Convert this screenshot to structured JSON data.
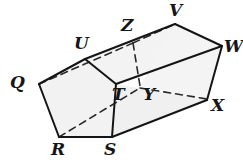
{
  "figure": {
    "type": "geometric-solid-diagram",
    "width": 243,
    "height": 166,
    "background_color": "#ffffff",
    "stroke_color": "#1a1a1a",
    "face_fill_color": "#f2f2f2",
    "hidden_edge_style": "dashed",
    "vertices": [
      {
        "name": "Q",
        "label": "Q",
        "x": 39,
        "y": 84,
        "label_x": 10,
        "label_y": 74,
        "hidden": false
      },
      {
        "name": "R",
        "label": "R",
        "x": 59,
        "y": 137,
        "label_x": 51,
        "label_y": 141,
        "hidden": false
      },
      {
        "name": "S",
        "label": "S",
        "x": 112,
        "y": 137,
        "label_x": 104,
        "label_y": 141,
        "hidden": false
      },
      {
        "name": "T",
        "label": "T",
        "x": 116,
        "y": 84,
        "label_x": 112,
        "label_y": 86,
        "hidden": false
      },
      {
        "name": "U",
        "label": "U",
        "x": 85,
        "y": 59,
        "label_x": 74,
        "label_y": 35,
        "hidden": false
      },
      {
        "name": "V",
        "label": "V",
        "x": 175,
        "y": 24,
        "label_x": 169,
        "label_y": 2,
        "hidden": false
      },
      {
        "name": "W",
        "label": "W",
        "x": 222,
        "y": 46,
        "label_x": 224,
        "label_y": 38,
        "hidden": false
      },
      {
        "name": "X",
        "label": "X",
        "x": 207,
        "y": 100,
        "label_x": 211,
        "label_y": 97,
        "hidden": false
      },
      {
        "name": "Y",
        "label": "Y",
        "x": 140,
        "y": 86,
        "label_x": 143,
        "label_y": 86,
        "hidden": true
      },
      {
        "name": "Z",
        "label": "Z",
        "x": 133,
        "y": 43,
        "label_x": 121,
        "label_y": 17,
        "hidden": true
      }
    ],
    "faces": [
      {
        "name": "front-pentagon-QRSTU",
        "points": "39,84 59,137 112,137 116,84 85,59",
        "fill": "#f2f2f2"
      },
      {
        "name": "top-face-UVWT-ZY",
        "points": "85,59 175,24 222,46 116,84",
        "fill": "#f2f2f2"
      },
      {
        "name": "right-face-VWXY",
        "points": "175,24 222,46 207,100 140,86",
        "fill": "#f2f2f2"
      },
      {
        "name": "bottom-face-STXY",
        "points": "112,137 116,84 207,100",
        "fill": "#f2f2f2"
      }
    ],
    "visible_edges": [
      {
        "name": "edge-QR",
        "from": "Q",
        "to": "R"
      },
      {
        "name": "edge-RS",
        "from": "R",
        "to": "S"
      },
      {
        "name": "edge-ST",
        "from": "S",
        "to": "T"
      },
      {
        "name": "edge-TU",
        "from": "T",
        "to": "U"
      },
      {
        "name": "edge-UQ",
        "from": "U",
        "to": "Q"
      },
      {
        "name": "edge-UV",
        "from": "U",
        "to": "V"
      },
      {
        "name": "edge-TW",
        "from": "T",
        "to": "W"
      },
      {
        "name": "edge-SX",
        "from": "S",
        "to": "X"
      },
      {
        "name": "edge-VW",
        "from": "V",
        "to": "W"
      },
      {
        "name": "edge-WX",
        "from": "W",
        "to": "X"
      }
    ],
    "hidden_edges": [
      {
        "name": "edge-QZ",
        "from": "Q",
        "to": "Z"
      },
      {
        "name": "edge-ZV",
        "from": "Z",
        "to": "V"
      },
      {
        "name": "edge-ZY",
        "from": "Z",
        "to": "Y"
      },
      {
        "name": "edge-RY",
        "from": "R",
        "to": "Y"
      },
      {
        "name": "edge-YX",
        "from": "Y",
        "to": "X"
      }
    ]
  }
}
